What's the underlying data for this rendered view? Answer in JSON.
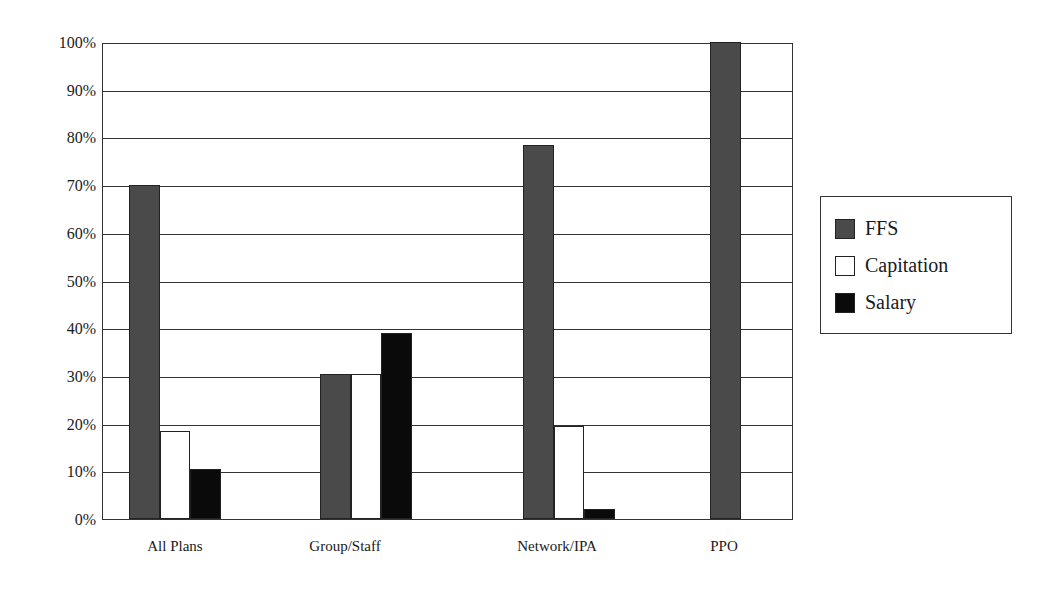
{
  "chart_data": {
    "type": "bar",
    "title": "",
    "xlabel": "",
    "ylabel": "",
    "ylim": [
      0,
      100
    ],
    "y_ticks": [
      "0%",
      "10%",
      "20%",
      "30%",
      "40%",
      "50%",
      "60%",
      "70%",
      "80%",
      "90%",
      "100%"
    ],
    "grid": true,
    "legend_position": "right",
    "categories": [
      "All Plans",
      "Group/Staff",
      "Network/IPA",
      "PPO"
    ],
    "series": [
      {
        "name": "FFS",
        "color": "#4a4a4a",
        "values": [
          70,
          30.5,
          78.5,
          100
        ]
      },
      {
        "name": "Capitation",
        "color": "#ffffff",
        "values": [
          18.5,
          30.5,
          19.5,
          0
        ]
      },
      {
        "name": "Salary",
        "color": "#0a0a0a",
        "values": [
          10.5,
          39,
          2,
          0
        ]
      }
    ]
  },
  "legend": {
    "items": [
      {
        "label": "FFS",
        "color": "#4a4a4a"
      },
      {
        "label": "Capitation",
        "color": "#ffffff"
      },
      {
        "label": "Salary",
        "color": "#0a0a0a"
      }
    ]
  }
}
